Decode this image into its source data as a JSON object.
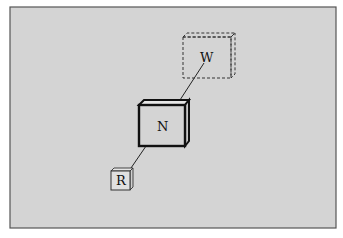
{
  "diagram": {
    "type": "spatial-layout",
    "background": "#d4d4d4",
    "border_color": "#555555",
    "nodes": [
      {
        "id": "W",
        "label": "W",
        "style": "dashed",
        "size": "medium"
      },
      {
        "id": "N",
        "label": "N",
        "style": "bold",
        "size": "large"
      },
      {
        "id": "R",
        "label": "R",
        "style": "thin",
        "size": "small"
      }
    ],
    "edges": [
      {
        "from": "N",
        "to": "W"
      },
      {
        "from": "N",
        "to": "R"
      }
    ]
  }
}
